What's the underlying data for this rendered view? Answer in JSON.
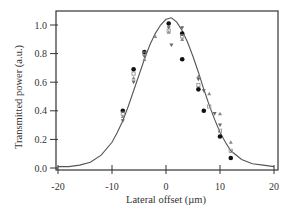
{
  "chart_data": {
    "type": "scatter",
    "title": "",
    "xlabel": "Lateral offset (µm)",
    "ylabel": "Transmitted power (a.u.)",
    "xlim": [
      -20,
      20
    ],
    "ylim": [
      0.0,
      1.1
    ],
    "xticks": [
      -20,
      -10,
      0,
      10,
      20
    ],
    "xtick_labels": [
      "-20",
      "-10",
      "0",
      "10",
      "20"
    ],
    "yticks": [
      0.0,
      0.2,
      0.4,
      0.6,
      0.8,
      1.0
    ],
    "ytick_labels": [
      "0.0",
      "0.2",
      "0.4",
      "0.6",
      "0.8",
      "1.0"
    ],
    "grid": false,
    "legend": "none",
    "series": [
      {
        "name": "Gaussian fit",
        "kind": "line",
        "color": "#555555",
        "x": [
          -20,
          -18,
          -16,
          -14,
          -12,
          -10,
          -9,
          -8,
          -7,
          -6,
          -5,
          -4,
          -3,
          -2,
          -1,
          0,
          1,
          2,
          3,
          4,
          5,
          6,
          7,
          8,
          9,
          10,
          11,
          12,
          14,
          16,
          18,
          20
        ],
        "y": [
          0.01,
          0.01,
          0.02,
          0.04,
          0.09,
          0.18,
          0.25,
          0.33,
          0.43,
          0.54,
          0.65,
          0.76,
          0.86,
          0.94,
          1.0,
          1.04,
          1.05,
          1.02,
          0.96,
          0.88,
          0.78,
          0.67,
          0.55,
          0.44,
          0.34,
          0.25,
          0.18,
          0.12,
          0.06,
          0.03,
          0.02,
          0.01
        ]
      },
      {
        "name": "Data A (filled circles)",
        "kind": "scatter",
        "marker": "circle",
        "color": "#111111",
        "x": [
          -8,
          -6,
          -4,
          0.5,
          3,
          3,
          6,
          7,
          10,
          12
        ],
        "y": [
          0.4,
          0.69,
          0.81,
          1.01,
          0.94,
          0.76,
          0.55,
          0.4,
          0.22,
          0.07
        ]
      },
      {
        "name": "Data B (triangles down)",
        "kind": "scatter",
        "marker": "triangle-down",
        "color": "#666666",
        "x": [
          -8,
          -6,
          -4,
          0.5,
          1,
          3,
          6,
          7,
          9,
          10
        ],
        "y": [
          0.33,
          0.6,
          0.78,
          0.98,
          0.86,
          0.98,
          0.62,
          0.54,
          0.38,
          0.3
        ]
      },
      {
        "name": "Data C (triangles up)",
        "kind": "scatter",
        "marker": "triangle-up",
        "color": "#888888",
        "x": [
          -8,
          -6,
          -4,
          -2,
          0.5,
          3,
          6,
          8,
          10,
          12
        ],
        "y": [
          0.36,
          0.63,
          0.76,
          0.92,
          0.95,
          0.9,
          0.64,
          0.52,
          0.38,
          0.18
        ]
      },
      {
        "name": "Data D (open squares)",
        "kind": "scatter",
        "marker": "square",
        "color": "#999999",
        "x": [
          -8,
          -6,
          -4,
          0.5,
          3,
          6,
          8,
          10,
          12
        ],
        "y": [
          0.38,
          0.66,
          0.8,
          0.96,
          0.92,
          0.58,
          0.43,
          0.26,
          0.12
        ]
      }
    ]
  }
}
